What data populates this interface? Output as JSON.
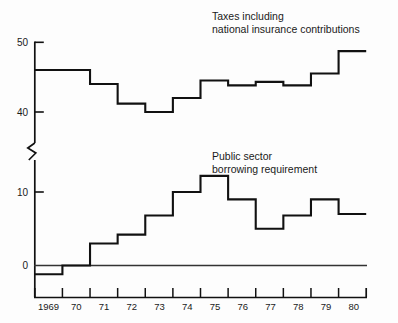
{
  "chart_data": {
    "type": "line",
    "title": "",
    "subtitle": "",
    "xlabel": "",
    "ylabel": "",
    "grid": false,
    "legend_position": "inline-annotation",
    "step_style": "step-mid",
    "axis_break": true,
    "axis_break_note": "y-axis broken between 0-10 band and 40-50 band",
    "x": [
      1969,
      1970,
      1971,
      1972,
      1973,
      1974,
      1975,
      1976,
      1977,
      1978,
      1979,
      1980
    ],
    "xtick_labels": [
      "1969",
      "70",
      "71",
      "72",
      "73",
      "74",
      "75",
      "76",
      "77",
      "78",
      "79",
      "80"
    ],
    "upper_panel": {
      "ylim": [
        38.5,
        50.5
      ],
      "ytick_values": [
        40,
        50
      ],
      "ytick_labels": [
        "40",
        "50"
      ],
      "series_name": "Taxes including national insurance contributions",
      "values": [
        46,
        46,
        44,
        41.2,
        40,
        40,
        42,
        42.6,
        44.5,
        43.8,
        44.3,
        43.8,
        43.8,
        45.5,
        48.7
      ]
    },
    "lower_panel": {
      "ylim": [
        -2,
        13
      ],
      "ytick_values": [
        0,
        10
      ],
      "ytick_labels": [
        "0",
        "10"
      ],
      "series_name": "Public sector borrowing requirement",
      "values": [
        -1.2,
        -1.2,
        0,
        0,
        3,
        3.2,
        4.2,
        6.8,
        7,
        10,
        10,
        12.2,
        12.2,
        9,
        9,
        5,
        5,
        6.8,
        6.8,
        9,
        9,
        7,
        7
      ]
    },
    "series": [
      {
        "name": "Taxes including national insurance contributions",
        "panel": "upper",
        "steps": [
          {
            "x_from": 1968.5,
            "x_to": 1970.5,
            "value": 46
          },
          {
            "x_from": 1970.5,
            "x_to": 1971.5,
            "value": 44
          },
          {
            "x_from": 1971.5,
            "x_to": 1972.5,
            "value": 41.2
          },
          {
            "x_from": 1972.5,
            "x_to": 1973.5,
            "value": 40
          },
          {
            "x_from": 1973.5,
            "x_to": 1974.5,
            "value": 42
          },
          {
            "x_from": 1974.5,
            "x_to": 1975.5,
            "value": 44.5
          },
          {
            "x_from": 1975.5,
            "x_to": 1976.5,
            "value": 43.8
          },
          {
            "x_from": 1976.5,
            "x_to": 1977.5,
            "value": 44.3
          },
          {
            "x_from": 1977.5,
            "x_to": 1978.5,
            "value": 43.8
          },
          {
            "x_from": 1978.5,
            "x_to": 1979.5,
            "value": 45.5
          },
          {
            "x_from": 1979.5,
            "x_to": 1980.5,
            "value": 48.7
          }
        ]
      },
      {
        "name": "Public sector borrowing requirement",
        "panel": "lower",
        "steps": [
          {
            "x_from": 1968.5,
            "x_to": 1969.5,
            "value": -1.2
          },
          {
            "x_from": 1969.5,
            "x_to": 1970.5,
            "value": 0
          },
          {
            "x_from": 1970.5,
            "x_to": 1971.5,
            "value": 3
          },
          {
            "x_from": 1971.5,
            "x_to": 1972.5,
            "value": 4.2
          },
          {
            "x_from": 1972.5,
            "x_to": 1973.5,
            "value": 6.8
          },
          {
            "x_from": 1973.5,
            "x_to": 1974.5,
            "value": 10
          },
          {
            "x_from": 1974.5,
            "x_to": 1975.5,
            "value": 12.2
          },
          {
            "x_from": 1975.5,
            "x_to": 1976.5,
            "value": 9
          },
          {
            "x_from": 1976.5,
            "x_to": 1977.5,
            "value": 5
          },
          {
            "x_from": 1977.5,
            "x_to": 1978.5,
            "value": 6.8
          },
          {
            "x_from": 1978.5,
            "x_to": 1979.5,
            "value": 9
          },
          {
            "x_from": 1979.5,
            "x_to": 1980.5,
            "value": 7
          }
        ]
      }
    ],
    "annotations": [
      {
        "id": "taxes",
        "line1": "Taxes including",
        "line2": "national insurance contributions"
      },
      {
        "id": "psbr",
        "line1": "Public sector",
        "line2": "borrowing requirement"
      }
    ],
    "colors": {
      "background": "#fdfdfd",
      "ink": "#111111",
      "series_line": "#111111",
      "axis": "#111111",
      "zero_line": "#333333"
    }
  },
  "ytick_upper": {
    "top": "50",
    "bottom": "40"
  },
  "ytick_lower": {
    "top": "10",
    "bottom": "0"
  },
  "xticks": {
    "t0": "1969",
    "t1": "70",
    "t2": "71",
    "t3": "72",
    "t4": "73",
    "t5": "74",
    "t6": "75",
    "t7": "76",
    "t8": "77",
    "t9": "78",
    "t10": "79",
    "t11": "80"
  },
  "annotations": {
    "taxes_line1": "Taxes including",
    "taxes_line2": "national insurance contributions",
    "psbr_line1": "Public sector",
    "psbr_line2": "borrowing requirement"
  }
}
